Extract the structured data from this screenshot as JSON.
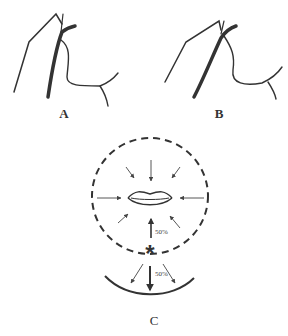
{
  "panels": [
    {
      "id": "A",
      "label": "A"
    },
    {
      "id": "B",
      "label": "B"
    },
    {
      "id": "C",
      "label": "C"
    }
  ],
  "panel_c": {
    "upper_arrow_label": "50%",
    "lower_arrow_label": "50%",
    "center_marker": "*"
  },
  "colors": {
    "stroke": "#333333",
    "background": "#ffffff"
  }
}
